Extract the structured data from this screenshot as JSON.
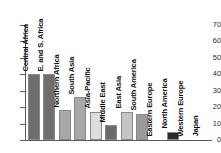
{
  "chart_data": {
    "type": "bar",
    "title": "",
    "subtitle": "",
    "xlabel": "",
    "ylabel": "",
    "ylim": [
      0,
      70
    ],
    "yticks": [
      0,
      10,
      20,
      30,
      40,
      50,
      60,
      70
    ],
    "grid": false,
    "legend": null,
    "categories": [
      "Central Africa",
      "E. and S. Africa",
      "Northern Africa",
      "South Asia",
      "Asia-Pacific",
      "Middle East",
      "East Asia",
      "South America",
      "Eastern Europe",
      "North America",
      "Western Europe",
      "Japan"
    ],
    "values": [
      40,
      40,
      18,
      26,
      17,
      9,
      17,
      16,
      0,
      5,
      0,
      0
    ],
    "bar_colors": [
      "#6e6e6e",
      "#6e6e6e",
      "#a8a8a8",
      "#a8a8a8",
      "#dcdcdc",
      "#6b6b6b",
      "#c4c4c4",
      "#9a9a9a",
      "#c0c0c0",
      "#2b2b2b",
      "#c0c0c0",
      "#c0c0c0"
    ],
    "axis_color": "#5a5a5a",
    "background": "#ffffff"
  }
}
